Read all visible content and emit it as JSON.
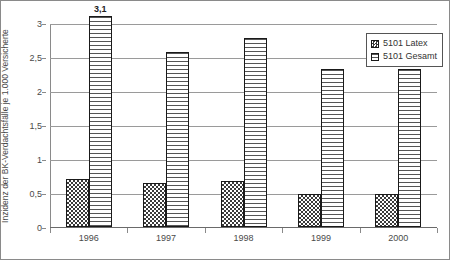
{
  "chart_data": {
    "type": "bar",
    "title": "",
    "subtitle": "",
    "xlabel": "",
    "ylabel": "Inzidenz der BK-Verdachtsfälle je 1.000 Versicherte",
    "categories": [
      "1996",
      "1997",
      "1998",
      "1999",
      "2000"
    ],
    "series": [
      {
        "name": "5101 Latex",
        "values": [
          0.7,
          0.64,
          0.68,
          0.48,
          0.48
        ],
        "pattern": "speckled",
        "color": "#3b3b3b"
      },
      {
        "name": "5101 Gesamt",
        "values": [
          3.1,
          2.58,
          2.78,
          2.33,
          2.33
        ],
        "pattern": "horizontal-lines",
        "color": "#555555"
      }
    ],
    "data_labels": [
      {
        "series": "5101 Gesamt",
        "category": "1996",
        "text": "3,1"
      }
    ],
    "ylim": [
      0,
      3
    ],
    "yticks": [
      0,
      0.5,
      1,
      1.5,
      2,
      2.5,
      3
    ],
    "ytick_labels": [
      "0",
      "0,5",
      "1",
      "1,5",
      "2",
      "2,5",
      "3"
    ],
    "grid": true,
    "grid_axis": "y",
    "legend_position": "top-right",
    "border": true
  },
  "legend": {
    "items": [
      {
        "label": "5101 Latex",
        "icon": "legend-swatch-speckled"
      },
      {
        "label": "5101 Gesamt",
        "icon": "legend-swatch-striped"
      }
    ]
  }
}
